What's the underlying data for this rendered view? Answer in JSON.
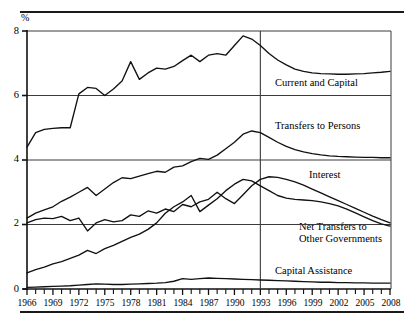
{
  "figure": {
    "y_axis_unit": "%",
    "divider_year": 1993,
    "note_rules": [
      "top-rule",
      "bottom-rule"
    ]
  },
  "chart_data": {
    "type": "line",
    "title": "",
    "subtitle": "",
    "xlabel": "",
    "ylabel": "%",
    "ylim": [
      0,
      8
    ],
    "xlim": [
      1966,
      2008
    ],
    "yticks": [
      0,
      2,
      4,
      6,
      8
    ],
    "ytick_labels": [
      "0",
      "2",
      "4",
      "6",
      "8"
    ],
    "xticks": [
      1966,
      1969,
      1972,
      1975,
      1978,
      1981,
      1984,
      1987,
      1990,
      1993,
      1996,
      1999,
      2002,
      2005,
      2008
    ],
    "xtick_labels": [
      "1966",
      "1969",
      "1972",
      "1975",
      "1978",
      "1981",
      "1984",
      "1987",
      "1990",
      "1993",
      "1996",
      "1999",
      "2002",
      "2005",
      "2008"
    ],
    "minor_xticks_every": 1,
    "grid": "horizontal",
    "legend": "inline-annotations",
    "annotations": [
      {
        "text": "Current and Capital",
        "x": 1994.0,
        "y": 5.72
      },
      {
        "text": "Transfers to Persons",
        "x": 1994.0,
        "y": 4.6
      },
      {
        "text": "Interest",
        "x": 1998.0,
        "y": 3.42
      },
      {
        "text": "Net Transfers to\nOther Governments",
        "x": 1994.0,
        "y": 1.92
      },
      {
        "text": "Capital Assistance",
        "x": 1994.0,
        "y": 0.5
      }
    ],
    "divider": {
      "x": 1993,
      "label": ""
    },
    "x": [
      1966,
      1967,
      1968,
      1969,
      1970,
      1971,
      1972,
      1973,
      1974,
      1975,
      1976,
      1977,
      1978,
      1979,
      1980,
      1981,
      1982,
      1983,
      1984,
      1985,
      1986,
      1987,
      1988,
      1989,
      1990,
      1991,
      1992,
      1993,
      1994,
      1995,
      1996,
      1997,
      1998,
      1999,
      2000,
      2001,
      2002,
      2003,
      2004,
      2005,
      2006,
      2007,
      2008
    ],
    "series": [
      {
        "name": "Current and Capital",
        "values": [
          4.4,
          4.85,
          4.95,
          4.98,
          5.0,
          5.0,
          6.05,
          6.25,
          6.22,
          6.0,
          6.2,
          6.45,
          7.05,
          6.5,
          6.7,
          6.85,
          6.82,
          6.9,
          7.08,
          7.25,
          7.05,
          7.25,
          7.3,
          7.25,
          7.55,
          7.85,
          7.75,
          7.55,
          7.3,
          7.1,
          6.95,
          6.82,
          6.75,
          6.7,
          6.68,
          6.67,
          6.66,
          6.66,
          6.67,
          6.68,
          6.7,
          6.72,
          6.75
        ]
      },
      {
        "name": "Transfers to Persons",
        "values": [
          2.2,
          2.35,
          2.45,
          2.55,
          2.72,
          2.85,
          3.0,
          3.15,
          2.9,
          3.1,
          3.3,
          3.45,
          3.42,
          3.5,
          3.58,
          3.65,
          3.62,
          3.78,
          3.82,
          3.95,
          4.05,
          4.02,
          4.15,
          4.35,
          4.55,
          4.8,
          4.9,
          4.85,
          4.7,
          4.55,
          4.42,
          4.32,
          4.25,
          4.2,
          4.16,
          4.13,
          4.11,
          4.1,
          4.09,
          4.08,
          4.08,
          4.07,
          4.07
        ]
      },
      {
        "name": "Interest",
        "values": [
          2.05,
          2.15,
          2.2,
          2.18,
          2.25,
          2.12,
          2.2,
          1.8,
          2.05,
          2.15,
          2.08,
          2.12,
          2.3,
          2.25,
          2.42,
          2.35,
          2.48,
          2.4,
          2.62,
          2.55,
          2.7,
          2.78,
          3.0,
          2.8,
          2.65,
          2.92,
          3.2,
          3.4,
          3.48,
          3.46,
          3.4,
          3.32,
          3.22,
          3.1,
          2.98,
          2.86,
          2.74,
          2.62,
          2.5,
          2.38,
          2.26,
          2.15,
          2.05
        ]
      },
      {
        "name": "Net Transfers to Other Governments",
        "values": [
          0.5,
          0.6,
          0.68,
          0.78,
          0.85,
          0.95,
          1.05,
          1.2,
          1.1,
          1.25,
          1.35,
          1.48,
          1.6,
          1.7,
          1.85,
          2.05,
          2.35,
          2.55,
          2.7,
          2.9,
          2.4,
          2.6,
          2.8,
          3.05,
          3.25,
          3.4,
          3.35,
          3.2,
          3.05,
          2.9,
          2.82,
          2.78,
          2.76,
          2.74,
          2.7,
          2.65,
          2.58,
          2.48,
          2.36,
          2.24,
          2.12,
          2.02,
          1.95
        ]
      },
      {
        "name": "Capital Assistance",
        "values": [
          0.05,
          0.06,
          0.07,
          0.08,
          0.09,
          0.1,
          0.12,
          0.14,
          0.16,
          0.15,
          0.14,
          0.14,
          0.15,
          0.16,
          0.17,
          0.18,
          0.2,
          0.24,
          0.32,
          0.3,
          0.32,
          0.34,
          0.33,
          0.32,
          0.31,
          0.3,
          0.29,
          0.28,
          0.27,
          0.26,
          0.25,
          0.24,
          0.23,
          0.22,
          0.21,
          0.21,
          0.2,
          0.2,
          0.19,
          0.19,
          0.18,
          0.18,
          0.18
        ]
      }
    ]
  },
  "ytick_labels": {
    "t0": "0",
    "t2": "2",
    "t4": "4",
    "t6": "6",
    "t8": "8"
  },
  "xtick_labels": {
    "x1966": "1966",
    "x1969": "1969",
    "x1972": "1972",
    "x1975": "1975",
    "x1978": "1978",
    "x1981": "1981",
    "x1984": "1984",
    "x1987": "1987",
    "x1990": "1990",
    "x1993": "1993",
    "x1996": "1996",
    "x1999": "1999",
    "x2002": "2002",
    "x2005": "2005",
    "x2008": "2008"
  },
  "series_labels": {
    "current_and_capital": "Current and Capital",
    "transfers_to_persons": "Transfers to Persons",
    "interest": "Interest",
    "net_transfers_line1": "Net Transfers to",
    "net_transfers_line2": "Other Governments",
    "capital_assistance": "Capital Assistance"
  },
  "colors": {
    "ink": "#1a1a1a",
    "line": "#111111",
    "grid": "#3a3a3a",
    "background": "#ffffff"
  }
}
